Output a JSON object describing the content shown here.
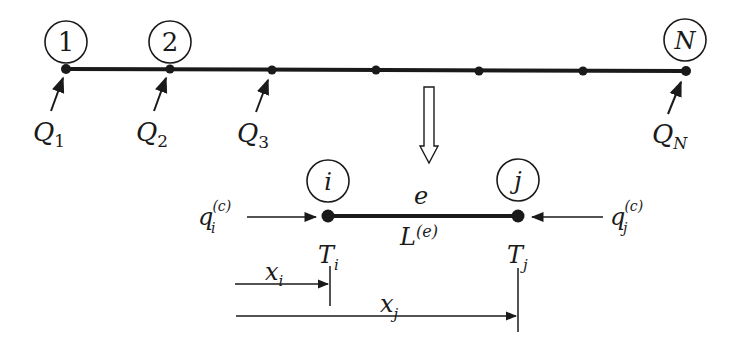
{
  "global_mesh": {
    "node_labels": [
      "1",
      "2",
      "N"
    ],
    "node_x": [
      66,
      170,
      272,
      376,
      479,
      583,
      686
    ],
    "line_y": 69,
    "flux_labels": [
      {
        "base": "Q",
        "sub": "1"
      },
      {
        "base": "Q",
        "sub": "2"
      },
      {
        "base": "Q",
        "sub": "3"
      },
      {
        "base": "Q",
        "sub": "N"
      }
    ]
  },
  "element": {
    "label": "e",
    "length_base": "L",
    "length_sup": "(e)",
    "node_i": {
      "label": "i",
      "temp_base": "T",
      "temp_sub": "i",
      "flux_base": "q",
      "flux_sub": "i",
      "flux_sup": "(c)"
    },
    "node_j": {
      "label": "j",
      "temp_base": "T",
      "temp_sub": "j",
      "flux_base": "q",
      "flux_sub": "j",
      "flux_sup": "(c)"
    },
    "dim_i": {
      "base": "x",
      "sub": "i"
    },
    "dim_j": {
      "base": "x",
      "sub": "j"
    }
  },
  "colors": {
    "stroke": "#1a1a1a",
    "background": "#ffffff"
  }
}
